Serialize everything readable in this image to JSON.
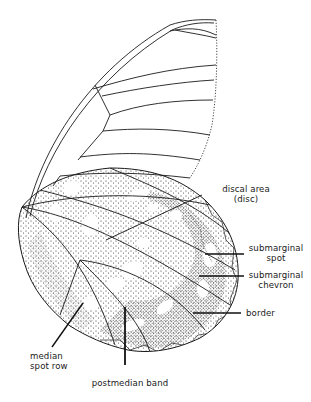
{
  "figure": {
    "colors": {
      "ink": "#1a1a1a",
      "stipple": "#2b2b2b",
      "background": "#ffffff"
    }
  },
  "labels": {
    "discal_area": {
      "line1": "discal area",
      "line2": "(disc)"
    },
    "submarginal_spot": {
      "line1": "submarginal",
      "line2": "spot"
    },
    "submarginal_chevron": {
      "line1": "submarginal",
      "line2": "chevron"
    },
    "border": {
      "line1": "border"
    },
    "median_spot_row": {
      "line1": "median",
      "line2": "spot row"
    },
    "postmedian_band": {
      "line1": "postmedian band"
    }
  }
}
